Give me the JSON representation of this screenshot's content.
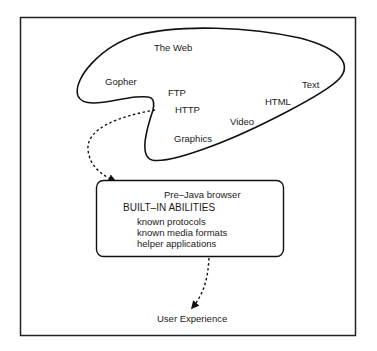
{
  "diagram": {
    "cloud": {
      "label": "The Web",
      "items": [
        "Gopher",
        "FTP",
        "HTTP",
        "Graphics",
        "Video",
        "HTML",
        "Text"
      ]
    },
    "browser_box": {
      "title": "Pre–Java browser",
      "heading": "BUILT–IN ABILITIES",
      "abilities": [
        "known protocols",
        "known media formats",
        "helper applications"
      ]
    },
    "output": {
      "label": "User Experience"
    },
    "colors": {
      "stroke": "#111111",
      "text": "#1a1a1a",
      "background": "#ffffff"
    }
  }
}
